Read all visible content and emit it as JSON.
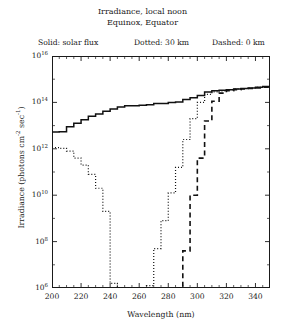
{
  "title": {
    "line1": "Irradiance, local noon",
    "line2": "Equinox, Equator"
  },
  "legend": {
    "solid": "Solid: solar flux",
    "dotted": "Dotted: 30 km",
    "dashed": "Dashed: 0 km"
  },
  "axes": {
    "xlabel": "Wavelength (nm)",
    "ylabel_pre": "Irradiance (photons cm",
    "ylabel_sup1": "-2",
    "ylabel_mid": " sec",
    "ylabel_sup2": "-1",
    "ylabel_post": ")",
    "xticks": [
      "200",
      "220",
      "240",
      "260",
      "280",
      "300",
      "320",
      "340"
    ],
    "yticks": [
      "10",
      "10",
      "10",
      "10",
      "10",
      "10"
    ],
    "yexps": [
      "6",
      "8",
      "10",
      "12",
      "14",
      "16"
    ]
  },
  "chart_data": {
    "type": "line",
    "xlabel": "Wavelength (nm)",
    "ylabel": "Irradiance (photons cm^-2 sec^-1)",
    "xlim": [
      200,
      350
    ],
    "ylim_log10": [
      6,
      16
    ],
    "yscale": "log",
    "grid": false,
    "legend_position": "above-plot",
    "xtick_values": [
      200,
      220,
      240,
      260,
      280,
      300,
      320,
      340
    ],
    "xtick_minor_step": 5,
    "ytick_log10_values": [
      6,
      8,
      10,
      12,
      14,
      16
    ],
    "ytick_minor_step_decades": 1,
    "series": [
      {
        "name": "solar flux",
        "style": "solid",
        "drawstyle": "steps",
        "x": [
          200,
          205,
          210,
          215,
          220,
          225,
          230,
          235,
          240,
          245,
          250,
          255,
          260,
          265,
          270,
          275,
          280,
          285,
          290,
          295,
          300,
          305,
          310,
          315,
          320,
          325,
          330,
          335,
          340,
          345,
          350
        ],
        "y_log10": [
          12.72,
          12.74,
          12.95,
          13.1,
          13.25,
          13.4,
          13.5,
          13.62,
          13.72,
          13.8,
          13.86,
          13.86,
          13.88,
          13.9,
          13.95,
          13.95,
          14.0,
          14.02,
          14.12,
          14.2,
          14.3,
          14.45,
          14.5,
          14.52,
          14.55,
          14.58,
          14.6,
          14.62,
          14.65,
          14.68,
          14.7
        ]
      },
      {
        "name": "30 km",
        "style": "dotted",
        "drawstyle": "steps",
        "x": [
          200,
          205,
          210,
          215,
          220,
          225,
          230,
          235,
          240,
          245,
          250,
          255,
          260,
          265,
          270,
          275,
          280,
          285,
          290,
          295,
          300,
          305,
          310,
          315,
          320,
          325,
          330,
          335,
          340,
          345,
          350
        ],
        "y_log10": [
          12.05,
          12.02,
          11.9,
          11.6,
          11.3,
          10.9,
          10.3,
          9.3,
          6.2,
          6.0,
          6.0,
          6.0,
          6.0,
          6.1,
          7.7,
          8.9,
          10.1,
          11.2,
          12.4,
          13.3,
          14.0,
          14.35,
          14.45,
          14.5,
          14.55,
          14.58,
          14.6,
          14.62,
          14.65,
          14.68,
          14.7
        ]
      },
      {
        "name": "0 km",
        "style": "dashed",
        "drawstyle": "steps",
        "x": [
          285,
          290,
          295,
          300,
          305,
          310,
          315,
          320,
          325,
          330,
          335,
          340,
          345,
          350
        ],
        "y_log10": [
          6.0,
          7.6,
          10.0,
          11.6,
          13.2,
          14.05,
          14.4,
          14.5,
          14.55,
          14.58,
          14.6,
          14.62,
          14.65,
          14.7
        ]
      }
    ]
  }
}
